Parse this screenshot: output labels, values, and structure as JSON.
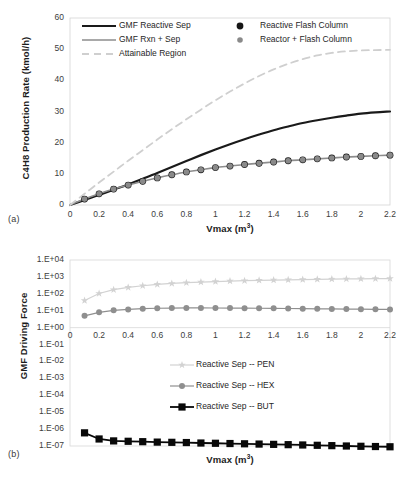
{
  "figure": {
    "panel_a_label": "(a)",
    "panel_b_label": "(b)"
  },
  "chart_data": [
    {
      "id": "panel-a",
      "type": "line",
      "title": "",
      "xlabel": "Vmax (m3)",
      "xlabel_base": "Vmax (m",
      "xlabel_sup": "3",
      "xlabel_tail": ")",
      "ylabel": "C4H8 Production Rate (kmol/h)",
      "xlim": [
        0,
        2.2
      ],
      "ylim": [
        0,
        60
      ],
      "xticks": [
        "0",
        "0.2",
        "0.4",
        "0.6",
        "0.8",
        "1",
        "1.2",
        "1.4",
        "1.6",
        "1.8",
        "2",
        "2.2"
      ],
      "xtick_values": [
        0,
        0.2,
        0.4,
        0.6,
        0.8,
        1,
        1.2,
        1.4,
        1.6,
        1.8,
        2,
        2.2
      ],
      "yticks": [
        "0",
        "10",
        "20",
        "30",
        "40",
        "50",
        "60"
      ],
      "ytick_values": [
        0,
        10,
        20,
        30,
        40,
        50,
        60
      ],
      "grid": false,
      "legend_position": "top-inside",
      "x": [
        0,
        0.1,
        0.2,
        0.3,
        0.4,
        0.5,
        0.6,
        0.7,
        0.8,
        0.9,
        1.0,
        1.1,
        1.2,
        1.3,
        1.4,
        1.5,
        1.6,
        1.7,
        1.8,
        1.9,
        2.0,
        2.1,
        2.2
      ],
      "series": [
        {
          "name": "GMF Reactive Sep",
          "style": "solid-line",
          "color": "#1a1a1a",
          "width": 2.2,
          "marker": "none",
          "values": [
            0,
            1.6,
            3.2,
            4.9,
            6.6,
            8.4,
            10.3,
            12.2,
            14.1,
            16.0,
            17.8,
            19.5,
            21.1,
            22.6,
            24.0,
            25.2,
            26.3,
            27.2,
            28.0,
            28.7,
            29.3,
            29.7,
            30.0
          ]
        },
        {
          "name": "GMF Rxn + Sep",
          "style": "solid-line",
          "color": "#8d8d8d",
          "width": 1.6,
          "marker": "none",
          "values": [
            0,
            1.9,
            3.6,
            5.1,
            6.4,
            7.6,
            8.7,
            9.7,
            10.6,
            11.3,
            12.0,
            12.5,
            13.0,
            13.4,
            13.8,
            14.2,
            14.5,
            14.8,
            15.1,
            15.4,
            15.6,
            15.8,
            16.0
          ]
        },
        {
          "name": "Attainable Region",
          "style": "dashed-line",
          "color": "#cfcfcf",
          "width": 1.8,
          "marker": "none",
          "values": [
            0,
            3.6,
            7.2,
            10.7,
            14.2,
            17.6,
            21.0,
            24.3,
            27.5,
            30.6,
            33.6,
            36.4,
            39.0,
            41.4,
            43.5,
            45.3,
            46.8,
            48.0,
            48.8,
            49.3,
            49.6,
            49.7,
            49.8
          ]
        },
        {
          "name": "Reactive Flash Column",
          "style": "markers",
          "color": "#161616",
          "marker": "circle",
          "marker_size": 3.4,
          "values": [
            0,
            1.9,
            3.6,
            5.1,
            6.4,
            7.6,
            8.7,
            9.7,
            10.6,
            11.3,
            12.0,
            12.5,
            13.0,
            13.4,
            13.8,
            14.2,
            14.5,
            14.8,
            15.1,
            15.4,
            15.6,
            15.8,
            16.0
          ]
        },
        {
          "name": "Reactor + Flash Column",
          "style": "markers",
          "color": "#8a8a8a",
          "marker": "circle",
          "marker_size": 2.8,
          "values": [
            0,
            1.9,
            3.6,
            5.1,
            6.4,
            7.6,
            8.7,
            9.7,
            10.6,
            11.3,
            12.0,
            12.5,
            13.0,
            13.4,
            13.8,
            14.2,
            14.5,
            14.8,
            15.1,
            15.4,
            15.6,
            15.8,
            16.0
          ]
        }
      ]
    },
    {
      "id": "panel-b",
      "type": "line",
      "title": "",
      "xlabel": "Vmax (m3)",
      "xlabel_base": "Vmax (m",
      "xlabel_sup": "3",
      "xlabel_tail": ")",
      "ylabel": "GMF Driving Force",
      "yscale": "log",
      "xlim": [
        0,
        2.2
      ],
      "ylim": [
        1e-07,
        10000.0
      ],
      "xticks": [
        "0",
        "0.2",
        "0.4",
        "0.6",
        "0.8",
        "1",
        "1.2",
        "1.4",
        "1.6",
        "1.8",
        "2",
        "2.2"
      ],
      "xtick_values": [
        0,
        0.2,
        0.4,
        0.6,
        0.8,
        1,
        1.2,
        1.4,
        1.6,
        1.8,
        2,
        2.2
      ],
      "yticks": [
        "1.E+04",
        "1.E+03",
        "1.E+02",
        "1.E+01",
        "1.E+00",
        "1.E-01",
        "1.E-02",
        "1.E-03",
        "1.E-04",
        "1.E-05",
        "1.E-06",
        "1.E-07"
      ],
      "ytick_values": [
        10000,
        1000,
        100,
        10,
        1,
        0.1,
        0.01,
        0.001,
        0.0001,
        1e-05,
        1e-06,
        1e-07
      ],
      "grid": false,
      "legend_position": "middle-center",
      "x": [
        0.1,
        0.2,
        0.3,
        0.4,
        0.5,
        0.6,
        0.7,
        0.8,
        0.9,
        1.0,
        1.1,
        1.2,
        1.3,
        1.4,
        1.5,
        1.6,
        1.7,
        1.8,
        1.9,
        2.0,
        2.1,
        2.2
      ],
      "series": [
        {
          "name": "Reactive Sep -- PEN",
          "style": "line-marker",
          "color": "#d2d2d2",
          "marker": "star",
          "marker_size": 3.2,
          "values": [
            40,
            105,
            175,
            240,
            300,
            360,
            410,
            455,
            495,
            530,
            565,
            595,
            625,
            650,
            675,
            700,
            720,
            740,
            760,
            775,
            790,
            800
          ]
        },
        {
          "name": "Reactive Sep -- HEX",
          "style": "line-marker",
          "color": "#8f8f8f",
          "marker": "circle",
          "marker_size": 3.0,
          "values": [
            5.0,
            8.0,
            10.5,
            12.0,
            13.2,
            14.0,
            14.4,
            14.6,
            14.6,
            14.5,
            14.4,
            14.2,
            14.0,
            13.8,
            13.5,
            13.2,
            13.0,
            12.7,
            12.5,
            12.3,
            12.1,
            12.0
          ]
        },
        {
          "name": "Reactive Sep -- BUT",
          "style": "line-marker",
          "color": "#080808",
          "marker": "square",
          "marker_size": 3.6,
          "values": [
            6e-07,
            2.6e-07,
            2e-07,
            1.9e-07,
            1.8e-07,
            1.7e-07,
            1.65e-07,
            1.6e-07,
            1.5e-07,
            1.45e-07,
            1.4e-07,
            1.35e-07,
            1.3e-07,
            1.25e-07,
            1.2e-07,
            1.15e-07,
            1.1e-07,
            1.05e-07,
            1e-07,
            9.6e-08,
            9.3e-08,
            9e-08
          ]
        }
      ]
    }
  ]
}
